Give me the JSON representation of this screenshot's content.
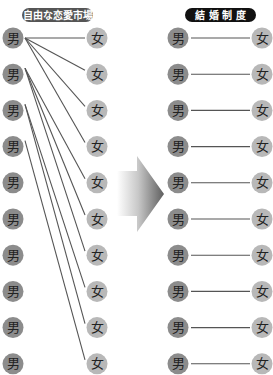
{
  "left_panel": {
    "title": "自由な恋愛市場",
    "man_label": "男",
    "woman_label": "女",
    "men_count": 10,
    "women_count": 10,
    "connections": [
      {
        "man": 1,
        "woman": 1
      },
      {
        "man": 1,
        "woman": 2
      },
      {
        "man": 1,
        "woman": 3
      },
      {
        "man": 1,
        "woman": 4
      },
      {
        "man": 2,
        "woman": 5
      },
      {
        "man": 2,
        "woman": 6
      },
      {
        "man": 2,
        "woman": 7
      },
      {
        "man": 3,
        "woman": 8
      },
      {
        "man": 3,
        "woman": 9
      },
      {
        "man": 4,
        "woman": 10
      }
    ]
  },
  "right_panel": {
    "title": "結 婚 制 度",
    "man_label": "男",
    "woman_label": "女",
    "pairs": 10
  },
  "arrow": {
    "direction": "right"
  },
  "colors": {
    "man_circle": "#8c8c8c",
    "woman_circle": "#b8b8b8",
    "left_title_bg": "#555555",
    "right_title_bg": "#111111",
    "line": "#555555",
    "arrow_dark": "#5e5e5e"
  }
}
